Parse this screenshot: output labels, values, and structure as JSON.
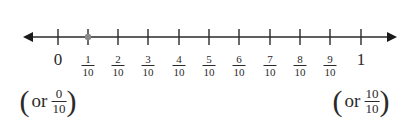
{
  "diagram": {
    "type": "number_line",
    "range": [
      0,
      1
    ],
    "step": "1/10",
    "marked_point": {
      "label": "1/10",
      "color": "#8a8a8a"
    },
    "ticks": [
      {
        "kind": "whole",
        "text": "0",
        "x": 58
      },
      {
        "kind": "frac",
        "num": "1",
        "den": "10",
        "x": 88
      },
      {
        "kind": "frac",
        "num": "2",
        "den": "10",
        "x": 118
      },
      {
        "kind": "frac",
        "num": "3",
        "den": "10",
        "x": 148
      },
      {
        "kind": "frac",
        "num": "4",
        "den": "10",
        "x": 179
      },
      {
        "kind": "frac",
        "num": "5",
        "den": "10",
        "x": 209
      },
      {
        "kind": "frac",
        "num": "6",
        "den": "10",
        "x": 239
      },
      {
        "kind": "frac",
        "num": "7",
        "den": "10",
        "x": 270
      },
      {
        "kind": "frac",
        "num": "8",
        "den": "10",
        "x": 300
      },
      {
        "kind": "frac",
        "num": "9",
        "den": "10",
        "x": 330
      },
      {
        "kind": "whole",
        "text": "1",
        "x": 361
      }
    ],
    "alternates": {
      "left": {
        "or": "or",
        "num": "0",
        "den": "10"
      },
      "right": {
        "or": "or",
        "num": "10",
        "den": "10"
      }
    },
    "colors": {
      "line": "#2a2a2a",
      "point": "#8a8a8a"
    }
  }
}
